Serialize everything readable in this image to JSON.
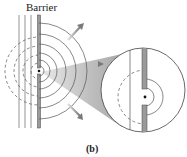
{
  "figure": {
    "barrier_label": "Barrier",
    "panel_label": "(b)",
    "colors": {
      "line": "#555555",
      "barrier_fill": "#9a9a9a",
      "arrow": "#8c8c8c",
      "cone": "#b5b5b5",
      "text": "#222222",
      "background": "#ffffff"
    },
    "left_view": {
      "description": "Waves incident on a barrier with a small aperture; circular wavefronts emanate from the aperture",
      "source_point": [
        39,
        71
      ],
      "arrows": [
        "upper-right",
        "right",
        "lower-right"
      ]
    },
    "magnified_view": {
      "description": "Magnified circular inset of the aperture showing barrier gap and wavefronts",
      "center": [
        143,
        90
      ],
      "radius": 43
    }
  }
}
